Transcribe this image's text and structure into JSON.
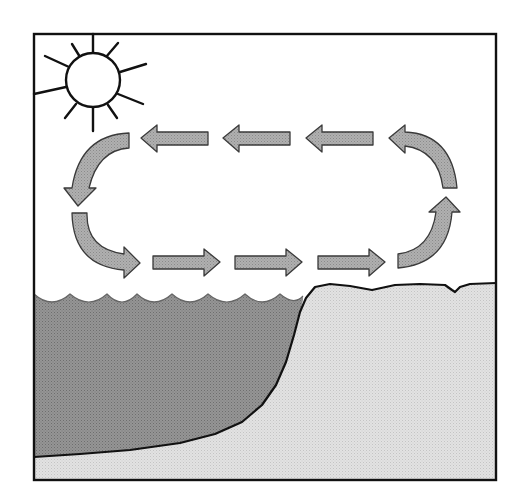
{
  "diagram": {
    "title": "Water cycle",
    "colors": {
      "frame": "#111111",
      "sky": "#ffffff",
      "water": "#8c8c8c",
      "land": "#dedede",
      "arrow_fill": "#a9a9a9",
      "arrow_stroke": "#3a3a3a",
      "sun_fill": "#ffffff",
      "sun_stroke": "#111111"
    },
    "elements": {
      "sun": "sun",
      "water": "ocean",
      "land": "land",
      "cycle": "clockwise-arrow-loop"
    },
    "arrows_top": [
      {
        "direction": "left"
      },
      {
        "direction": "left"
      },
      {
        "direction": "left"
      }
    ],
    "arrows_bottom": [
      {
        "direction": "right"
      },
      {
        "direction": "right"
      },
      {
        "direction": "right"
      }
    ],
    "curved_arrows": [
      {
        "position": "top-left",
        "direction": "down"
      },
      {
        "position": "bottom-left",
        "direction": "right"
      },
      {
        "position": "bottom-right",
        "direction": "up"
      },
      {
        "position": "top-right",
        "direction": "left"
      }
    ]
  }
}
